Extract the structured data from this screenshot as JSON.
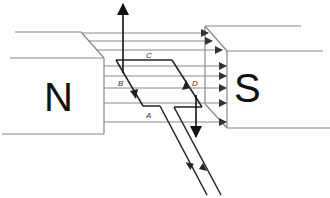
{
  "diagram": {
    "type": "electric-motor-principle",
    "magnets": {
      "north": {
        "label": "N"
      },
      "south": {
        "label": "S"
      }
    },
    "coil_edges": {
      "top": "C",
      "left": "B",
      "right": "D",
      "bottom": "A"
    },
    "field_lines_count": 8,
    "colors": {
      "outline": "#888888",
      "coil": "#222222",
      "text": "#111111",
      "background": "#ffffff"
    }
  }
}
